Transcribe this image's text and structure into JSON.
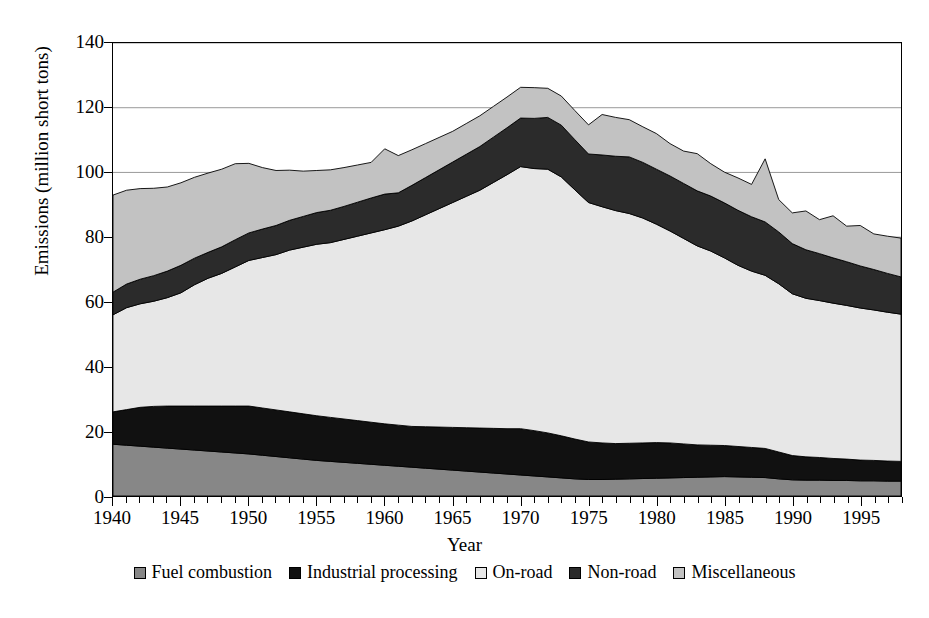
{
  "chart_data": {
    "type": "area",
    "stacked": true,
    "title": "",
    "xlabel": "Year",
    "ylabel": "Emissions (million short tons)",
    "xlim": [
      1940,
      1998
    ],
    "ylim": [
      0,
      140
    ],
    "ytick_step": 20,
    "yticks": [
      0,
      20,
      40,
      60,
      80,
      100,
      120,
      140
    ],
    "xticks_major": [
      1940,
      1945,
      1950,
      1955,
      1960,
      1965,
      1970,
      1975,
      1980,
      1985,
      1990,
      1995
    ],
    "xtick_minor_step": 1,
    "grid": "horizontal",
    "legend_position": "bottom",
    "x": [
      1940,
      1941,
      1942,
      1943,
      1944,
      1945,
      1946,
      1947,
      1948,
      1949,
      1950,
      1951,
      1952,
      1953,
      1954,
      1955,
      1956,
      1957,
      1958,
      1959,
      1960,
      1961,
      1962,
      1963,
      1964,
      1965,
      1966,
      1967,
      1968,
      1969,
      1970,
      1971,
      1972,
      1973,
      1974,
      1975,
      1976,
      1977,
      1978,
      1979,
      1980,
      1981,
      1982,
      1983,
      1984,
      1985,
      1986,
      1987,
      1988,
      1989,
      1990,
      1991,
      1992,
      1993,
      1994,
      1995,
      1996,
      1997,
      1998
    ],
    "series": [
      {
        "name": "Fuel combustion",
        "color": "#878787",
        "values": [
          16.0,
          15.7,
          15.4,
          15.1,
          14.8,
          14.5,
          14.2,
          13.9,
          13.6,
          13.3,
          13.0,
          12.6,
          12.2,
          11.8,
          11.4,
          11.0,
          10.7,
          10.4,
          10.1,
          9.8,
          9.5,
          9.2,
          8.9,
          8.6,
          8.3,
          8.0,
          7.7,
          7.4,
          7.1,
          6.8,
          6.5,
          6.2,
          5.9,
          5.6,
          5.3,
          5.1,
          5.1,
          5.2,
          5.3,
          5.4,
          5.5,
          5.6,
          5.7,
          5.8,
          5.9,
          6.0,
          5.9,
          5.8,
          5.7,
          5.3,
          5.0,
          4.9,
          4.9,
          4.8,
          4.8,
          4.7,
          4.7,
          4.6,
          4.6
        ]
      },
      {
        "name": "Industrial processing",
        "color": "#111111",
        "values": [
          10.0,
          11.0,
          12.0,
          12.6,
          13.0,
          13.3,
          13.6,
          13.9,
          14.2,
          14.5,
          14.8,
          14.6,
          14.4,
          14.2,
          14.0,
          13.8,
          13.6,
          13.4,
          13.2,
          13.0,
          12.8,
          12.7,
          12.6,
          12.8,
          13.0,
          13.2,
          13.4,
          13.6,
          13.8,
          14.0,
          14.3,
          14.0,
          13.6,
          13.0,
          12.3,
          11.6,
          11.3,
          11.0,
          11.0,
          11.0,
          11.0,
          10.8,
          10.4,
          10.0,
          9.8,
          9.6,
          9.4,
          9.2,
          9.0,
          8.3,
          7.5,
          7.2,
          7.0,
          6.8,
          6.6,
          6.4,
          6.3,
          6.2,
          6.1
        ]
      },
      {
        "name": "On-road",
        "color": "#e7e7e7",
        "values": [
          30.0,
          31.5,
          32.0,
          32.5,
          33.5,
          35.0,
          37.5,
          39.5,
          41.0,
          43.0,
          45.0,
          46.5,
          48.0,
          50.0,
          51.5,
          53.0,
          54.0,
          55.5,
          57.0,
          58.5,
          60.0,
          61.5,
          63.5,
          65.5,
          67.5,
          69.5,
          71.5,
          73.5,
          76.0,
          78.5,
          81.0,
          81.0,
          81.5,
          80.0,
          77.0,
          74.0,
          73.0,
          72.0,
          71.0,
          69.5,
          67.5,
          65.5,
          63.5,
          61.5,
          60.0,
          58.0,
          56.0,
          54.5,
          53.5,
          52.0,
          50.0,
          49.0,
          48.5,
          48.0,
          47.5,
          47.0,
          46.5,
          46.0,
          45.5
        ]
      },
      {
        "name": "Non-road",
        "color": "#2b2b2b",
        "values": [
          7.0,
          7.3,
          7.6,
          7.9,
          8.2,
          8.5,
          8.2,
          8.0,
          8.2,
          8.4,
          8.5,
          8.8,
          9.0,
          9.2,
          9.5,
          9.8,
          10.0,
          10.2,
          10.5,
          10.8,
          11.0,
          10.3,
          11.0,
          11.5,
          12.0,
          12.5,
          13.0,
          13.5,
          14.0,
          14.5,
          15.0,
          15.5,
          16.0,
          16.0,
          15.5,
          15.0,
          16.0,
          16.8,
          17.5,
          17.2,
          17.0,
          17.0,
          17.0,
          17.0,
          17.0,
          17.0,
          17.0,
          16.8,
          16.5,
          16.0,
          15.5,
          15.0,
          14.5,
          14.0,
          13.5,
          13.0,
          12.5,
          12.0,
          11.5
        ]
      },
      {
        "name": "Miscellaneous",
        "color": "#c2c2c2",
        "values": [
          30.0,
          29.0,
          28.0,
          27.0,
          26.0,
          25.5,
          25.0,
          24.5,
          24.0,
          23.5,
          21.5,
          19.0,
          17.0,
          15.5,
          14.0,
          13.0,
          12.5,
          12.0,
          11.5,
          11.0,
          14.0,
          11.5,
          11.0,
          10.5,
          10.0,
          9.5,
          9.5,
          9.5,
          9.5,
          9.5,
          9.5,
          9.5,
          9.0,
          9.0,
          9.0,
          9.0,
          12.5,
          12.0,
          11.5,
          11.0,
          11.0,
          10.0,
          10.0,
          11.5,
          10.0,
          9.5,
          10.0,
          10.0,
          19.5,
          10.0,
          9.5,
          12.0,
          10.5,
          13.0,
          11.0,
          12.5,
          11.0,
          11.5,
          12.0
        ]
      }
    ]
  },
  "legend": {
    "items": [
      {
        "label": "Fuel combustion",
        "color": "#878787"
      },
      {
        "label": "Industrial processing",
        "color": "#111111"
      },
      {
        "label": "On-road",
        "color": "#e7e7e7"
      },
      {
        "label": "Non-road",
        "color": "#2b2b2b"
      },
      {
        "label": "Miscellaneous",
        "color": "#c2c2c2"
      }
    ]
  },
  "axes": {
    "x_title": "Year",
    "y_title": "Emissions (million short tons)"
  }
}
